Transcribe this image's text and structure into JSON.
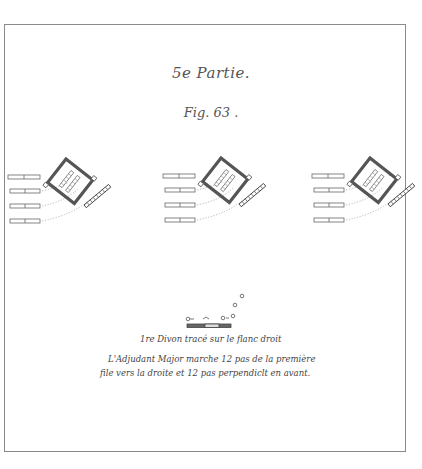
{
  "plate": {
    "section_title": "5e Partie.",
    "figure_label": "Fig. 63 .",
    "caption": {
      "line1": "1re Divon tracé sur le flanc droit",
      "line2": "L'Adjudant Major marche 12 pas de la première",
      "line3": "file vers la droite et 12 pas perpendiclt en avant."
    },
    "diagram_groups": [
      {
        "name": "formation-left",
        "x": 8
      },
      {
        "name": "formation-center",
        "x": 163
      },
      {
        "name": "formation-right",
        "x": 312
      }
    ],
    "colors": {
      "ink": "#555555",
      "frame": "#8a8a8a",
      "paper": "#ffffff"
    }
  }
}
